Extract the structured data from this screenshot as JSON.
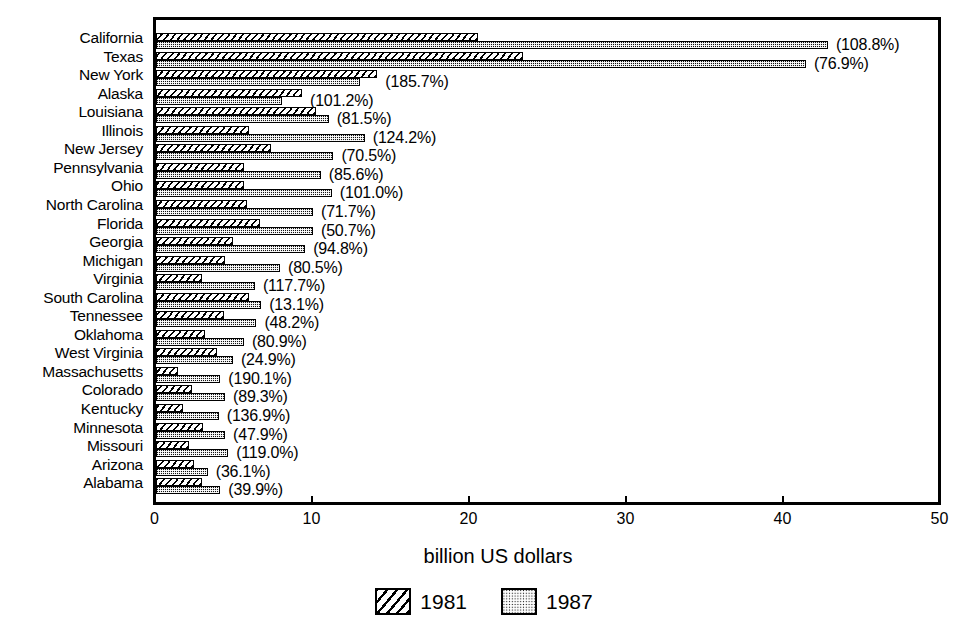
{
  "chart_data": {
    "type": "bar",
    "orientation": "horizontal",
    "grouped": true,
    "title": "",
    "xlabel": "billion US dollars",
    "ylabel": "",
    "xlim": [
      0,
      50
    ],
    "xticks": [
      0,
      10,
      20,
      30,
      40,
      50
    ],
    "xtick_labels": [
      "0",
      "10",
      "20",
      "30",
      "40",
      "50"
    ],
    "grid": false,
    "legend_position": "bottom",
    "legend": [
      "1981",
      "1987"
    ],
    "categories": [
      "California",
      "Texas",
      "New York",
      "Alaska",
      "Louisiana",
      "Illinois",
      "New Jersey",
      "Pennsylvania",
      "Ohio",
      "North Carolina",
      "Florida",
      "Georgia",
      "Michigan",
      "Virginia",
      "South Carolina",
      "Tennessee",
      "Oklahoma",
      "West Virginia",
      "Massachusetts",
      "Colorado",
      "Kentucky",
      "Minnesota",
      "Missouri",
      "Arizona",
      "Alabama"
    ],
    "series": [
      {
        "name": "1981",
        "values": [
          20.5,
          23.4,
          14.1,
          9.3,
          10.2,
          5.9,
          7.3,
          5.6,
          5.6,
          5.8,
          6.6,
          4.9,
          4.4,
          2.9,
          5.9,
          4.3,
          3.1,
          3.9,
          1.4,
          2.3,
          1.7,
          3.0,
          2.1,
          2.4,
          2.9
        ]
      },
      {
        "name": "1987",
        "values": [
          42.8,
          41.4,
          13.0,
          8.0,
          11.0,
          13.3,
          11.3,
          10.5,
          11.2,
          10.0,
          10.0,
          9.5,
          7.9,
          6.3,
          6.7,
          6.4,
          5.6,
          4.9,
          4.1,
          4.4,
          4.0,
          4.4,
          4.6,
          3.3,
          4.1
        ]
      }
    ],
    "annotations": [
      "(108.8%)",
      "(76.9%)",
      "(185.7%)",
      "(101.2%)",
      "(81.5%)",
      "(124.2%)",
      "(70.5%)",
      "(85.6%)",
      "(101.0%)",
      "(71.7%)",
      "(50.7%)",
      "(94.8%)",
      "(80.5%)",
      "(117.7%)",
      "(13.1%)",
      "(48.2%)",
      "(80.9%)",
      "(24.9%)",
      "(190.1%)",
      "(89.3%)",
      "(136.9%)",
      "(47.9%)",
      "(119.0%)",
      "(36.1%)",
      "(39.9%)"
    ],
    "annotation_note": "percent growth 1981 to 1987",
    "colors": {
      "series_1981_fill": "#ffffff",
      "series_1981_hatch": "#000000",
      "series_1987_fill": "#121212",
      "series_1987_hatch": "#ffffff",
      "axis": "#000000",
      "background": "#ffffff"
    }
  }
}
